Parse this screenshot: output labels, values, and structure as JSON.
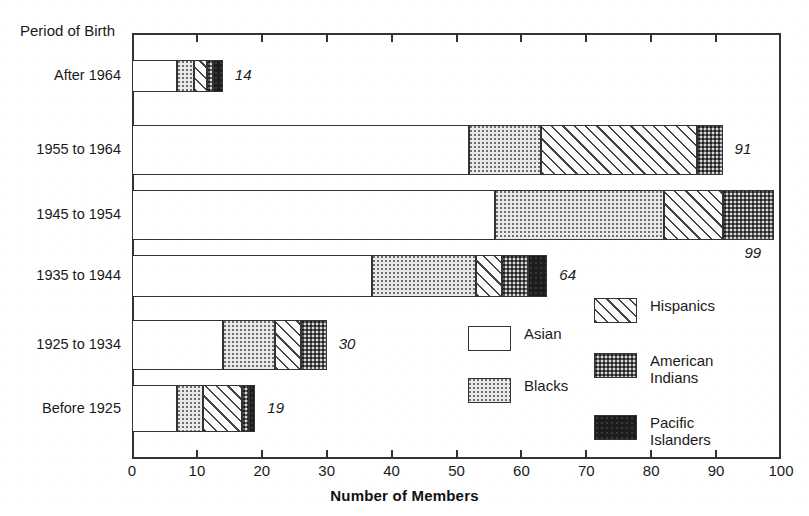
{
  "chart_data": {
    "type": "bar",
    "orientation": "horizontal",
    "stacked": true,
    "title": "",
    "xlabel": "Number of Members",
    "ylabel": "Period of Birth",
    "xlim": [
      0,
      100
    ],
    "xticks": [
      0,
      10,
      20,
      30,
      40,
      50,
      60,
      70,
      80,
      90,
      100
    ],
    "xticklabels": [
      "0",
      "10",
      "20",
      "30",
      "40",
      "50",
      "60",
      "70",
      "80",
      "90",
      "100"
    ],
    "grid": false,
    "legend_position": "inside-lower-right",
    "categories": [
      "After 1964",
      "1955 to 1964",
      "1945 to 1954",
      "1935 to 1944",
      "1925 to 1934",
      "Before 1925"
    ],
    "series": [
      {
        "name": "Asian",
        "pattern": "white",
        "values": [
          7,
          52,
          56,
          37,
          14,
          7
        ]
      },
      {
        "name": "Blacks",
        "pattern": "light-dots",
        "values": [
          2.5,
          11,
          26,
          16,
          8,
          4
        ]
      },
      {
        "name": "Hispanics",
        "pattern": "diagonal-hatch",
        "values": [
          2,
          24,
          9,
          4,
          4,
          6
        ]
      },
      {
        "name": "American Indians",
        "pattern": "dark-dots",
        "values": [
          1,
          4,
          8,
          4,
          4,
          1
        ]
      },
      {
        "name": "Pacific Islanders",
        "pattern": "solid-black",
        "values": [
          1.5,
          0,
          0,
          3,
          0,
          1
        ]
      }
    ],
    "totals": [
      14,
      91,
      99,
      64,
      30,
      19
    ],
    "total_labels": [
      "14",
      "91",
      "99",
      "64",
      "30",
      "19"
    ]
  },
  "legend": {
    "column_left": [
      {
        "label": "Asian",
        "pattern": "white"
      },
      {
        "label": "Blacks",
        "pattern": "light-dots"
      }
    ],
    "column_right": [
      {
        "label": "Hispanics",
        "pattern": "diagonal-hatch"
      },
      {
        "label": "American\nIndians",
        "pattern": "dark-dots"
      },
      {
        "label": "Pacific\nIslanders",
        "pattern": "solid-black"
      }
    ]
  },
  "colors": {
    "axis": "#333333",
    "text": "#1a1a1a",
    "asian": "#ffffff",
    "blacks": "#e9e9e9",
    "hispanics": "#fbfbfb",
    "american_indians": "#5e5e5e",
    "pacific_islanders": "#1d1d1d"
  }
}
